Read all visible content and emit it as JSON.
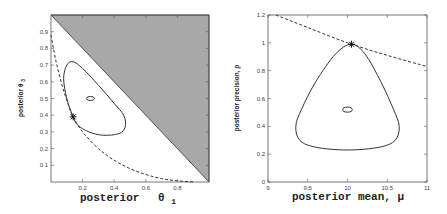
{
  "chart_data": [
    {
      "type": "line",
      "title": "",
      "xlabel": "posterior θ1",
      "ylabel": "posterior θ3",
      "xlim": [
        0,
        1
      ],
      "ylim": [
        0,
        1
      ],
      "xticks": [
        "0.2",
        "0.4",
        "0.6",
        "0.8"
      ],
      "yticks": [
        "0.1",
        "0.2",
        "0.3",
        "0.4",
        "0.5",
        "0.6",
        "0.7",
        "0.8",
        "0.9"
      ],
      "grid": false,
      "legend": null,
      "shaded_region": {
        "description": "infeasible region θ1 + θ3 > 1",
        "color": "#a8a8a8",
        "vertices": [
          [
            0,
            1
          ],
          [
            1,
            1
          ],
          [
            1,
            0
          ]
        ]
      },
      "series": [
        {
          "name": "outer contour",
          "style": "solid",
          "points": [
            [
              0.14,
              0.39
            ],
            [
              0.1,
              0.5
            ],
            [
              0.08,
              0.62
            ],
            [
              0.1,
              0.7
            ],
            [
              0.14,
              0.72
            ],
            [
              0.2,
              0.68
            ],
            [
              0.3,
              0.58
            ],
            [
              0.4,
              0.47
            ],
            [
              0.46,
              0.4
            ],
            [
              0.47,
              0.33
            ],
            [
              0.43,
              0.29
            ],
            [
              0.33,
              0.28
            ],
            [
              0.24,
              0.3
            ],
            [
              0.17,
              0.34
            ],
            [
              0.14,
              0.39
            ]
          ]
        },
        {
          "name": "inner contour",
          "style": "solid",
          "ellipse": {
            "cx": 0.25,
            "cy": 0.5,
            "rx": 0.025,
            "ry": 0.012
          }
        },
        {
          "name": "dashed constraint curve",
          "style": "dashed",
          "points": [
            [
              0.0,
              0.88
            ],
            [
              0.03,
              0.73
            ],
            [
              0.07,
              0.58
            ],
            [
              0.11,
              0.46
            ],
            [
              0.14,
              0.39
            ],
            [
              0.2,
              0.3
            ],
            [
              0.3,
              0.2
            ],
            [
              0.4,
              0.13
            ],
            [
              0.5,
              0.08
            ],
            [
              0.6,
              0.045
            ],
            [
              0.7,
              0.02
            ],
            [
              0.8,
              0.007
            ],
            [
              0.9,
              0.0
            ]
          ]
        },
        {
          "name": "optimum point",
          "style": "marker",
          "marker": "*",
          "points": [
            [
              0.14,
              0.39
            ]
          ]
        }
      ]
    },
    {
      "type": "line",
      "title": "",
      "xlabel": "posterior mean, μ",
      "ylabel": "posterior precision, ρ",
      "xlim": [
        9,
        11
      ],
      "ylim": [
        0,
        1.2
      ],
      "xticks": [
        "9",
        "9.5",
        "10",
        "10.5",
        "11"
      ],
      "yticks": [
        "0",
        "0.2",
        "0.4",
        "0.6",
        "0.8",
        "1",
        "1.2"
      ],
      "grid": false,
      "legend": null,
      "series": [
        {
          "name": "outer contour",
          "style": "solid",
          "points": [
            [
              10.05,
              0.99
            ],
            [
              9.85,
              0.92
            ],
            [
              9.6,
              0.72
            ],
            [
              9.42,
              0.52
            ],
            [
              9.35,
              0.4
            ],
            [
              9.4,
              0.3
            ],
            [
              9.6,
              0.25
            ],
            [
              10.0,
              0.23
            ],
            [
              10.4,
              0.25
            ],
            [
              10.6,
              0.3
            ],
            [
              10.65,
              0.4
            ],
            [
              10.58,
              0.52
            ],
            [
              10.42,
              0.72
            ],
            [
              10.22,
              0.92
            ],
            [
              10.05,
              0.99
            ]
          ]
        },
        {
          "name": "inner contour",
          "style": "solid",
          "ellipse": {
            "cx": 10.0,
            "cy": 0.52,
            "rx": 0.06,
            "ry": 0.018
          }
        },
        {
          "name": "dashed constraint curve",
          "style": "dashed",
          "points": [
            [
              9.1,
              1.2
            ],
            [
              9.5,
              1.11
            ],
            [
              10.0,
              1.0
            ],
            [
              10.5,
              0.91
            ],
            [
              11.0,
              0.83
            ]
          ]
        },
        {
          "name": "optimum point",
          "style": "marker",
          "marker": "*",
          "points": [
            [
              10.05,
              0.99
            ]
          ]
        }
      ]
    }
  ],
  "labels": {
    "left_xlabel_main": "posterior",
    "left_xlabel_sym": "θ",
    "left_xlabel_sub": "1",
    "left_ylabel_main": "posterior θ",
    "left_ylabel_sub": "3",
    "right_xlabel": "posterior mean, μ",
    "right_ylabel": "posterior precision, ρ"
  }
}
